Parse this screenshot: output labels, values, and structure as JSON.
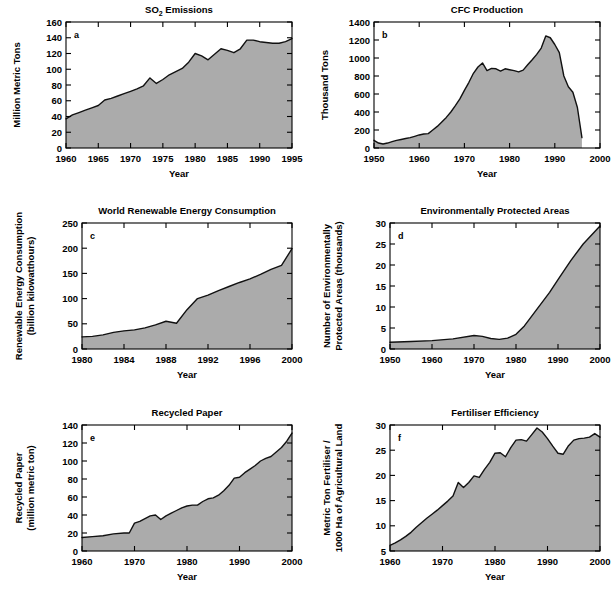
{
  "figure": {
    "background": "#ffffff",
    "series_fill": "#ababab",
    "series_stroke": "#1a1a1a",
    "axis_color": "#000000",
    "panel_count": 6
  },
  "chart_data": [
    {
      "id": "a",
      "panel_letter": "a",
      "type": "area",
      "title": "SO2 Emissions",
      "title_parts": {
        "pre": "SO",
        "sub": "2",
        "post": " Emissions"
      },
      "xlabel": "Year",
      "ylabel": "Million Metric Tons",
      "ylabel_lines": [
        "Million Metric Tons"
      ],
      "xlim": [
        1960,
        1995
      ],
      "ylim": [
        0,
        160
      ],
      "xticks": [
        1960,
        1965,
        1970,
        1975,
        1980,
        1985,
        1990,
        1995
      ],
      "yticks": [
        0,
        20,
        40,
        60,
        80,
        100,
        120,
        140,
        160
      ],
      "xtick_labels": [
        "1960",
        "1965",
        "1970",
        "1975",
        "1980",
        "1985",
        "1990",
        "1995"
      ],
      "ytick_labels": [
        "0",
        "20",
        "40",
        "60",
        "80",
        "100",
        "120",
        "140",
        "160"
      ],
      "grid": false,
      "legend": "none",
      "x": [
        1960,
        1961,
        1962,
        1963,
        1964,
        1965,
        1966,
        1967,
        1968,
        1969,
        1970,
        1971,
        1972,
        1973,
        1974,
        1975,
        1976,
        1977,
        1978,
        1979,
        1980,
        1981,
        1982,
        1983,
        1984,
        1985,
        1986,
        1987,
        1988,
        1989,
        1990,
        1991,
        1992,
        1993,
        1994,
        1995
      ],
      "values": [
        37,
        42,
        45,
        48,
        51,
        54,
        61,
        63,
        66,
        69,
        72,
        75,
        79,
        89,
        82,
        87,
        93,
        97,
        101,
        109,
        120,
        117,
        112,
        119,
        126,
        124,
        121,
        126,
        137,
        137,
        135,
        134,
        133,
        133,
        135,
        139
      ]
    },
    {
      "id": "b",
      "panel_letter": "b",
      "type": "area",
      "title": "CFC Production",
      "xlabel": "Year",
      "ylabel": "Thousand Tons",
      "ylabel_lines": [
        "Thousand Tons"
      ],
      "xlim": [
        1950,
        2000
      ],
      "ylim": [
        0,
        1400
      ],
      "xticks": [
        1950,
        1960,
        1970,
        1980,
        1990,
        2000
      ],
      "yticks": [
        0,
        200,
        400,
        600,
        800,
        1000,
        1200,
        1400
      ],
      "xtick_labels": [
        "1950",
        "1960",
        "1970",
        "1980",
        "1990",
        "2000"
      ],
      "ytick_labels": [
        "0",
        "200",
        "400",
        "600",
        "800",
        "1000",
        "1200",
        "1400"
      ],
      "grid": false,
      "legend": "none",
      "x": [
        1950,
        1951,
        1952,
        1953,
        1954,
        1955,
        1956,
        1957,
        1958,
        1959,
        1960,
        1961,
        1962,
        1963,
        1964,
        1965,
        1966,
        1967,
        1968,
        1969,
        1970,
        1971,
        1972,
        1973,
        1974,
        1975,
        1976,
        1977,
        1978,
        1979,
        1980,
        1981,
        1982,
        1983,
        1984,
        1985,
        1986,
        1987,
        1988,
        1989,
        1990,
        1991,
        1992,
        1993,
        1994,
        1995,
        1996
      ],
      "values": [
        85,
        55,
        45,
        55,
        70,
        85,
        95,
        105,
        115,
        130,
        145,
        155,
        160,
        200,
        240,
        290,
        340,
        400,
        470,
        545,
        640,
        730,
        830,
        900,
        945,
        860,
        885,
        880,
        855,
        880,
        870,
        860,
        845,
        865,
        925,
        980,
        1040,
        1110,
        1245,
        1225,
        1150,
        1060,
        800,
        680,
        620,
        450,
        115
      ]
    },
    {
      "id": "c",
      "panel_letter": "c",
      "type": "area",
      "title": "World Renewable Energy Consumption",
      "xlabel": "Year",
      "ylabel": "Renewable Energy Consumption (billion kilowatthours)",
      "ylabel_lines": [
        "Renewable Energy Consumption",
        "(billion kilowatthours)"
      ],
      "xlim": [
        1980,
        2000
      ],
      "ylim": [
        0,
        250
      ],
      "xticks": [
        1980,
        1984,
        1988,
        1992,
        1996,
        2000
      ],
      "yticks": [
        0,
        50,
        100,
        150,
        200,
        250
      ],
      "xtick_labels": [
        "1980",
        "1984",
        "1988",
        "1992",
        "1996",
        "2000"
      ],
      "ytick_labels": [
        "0",
        "50",
        "100",
        "150",
        "200",
        "250"
      ],
      "grid": false,
      "legend": "none",
      "x": [
        1980,
        1981,
        1982,
        1983,
        1984,
        1985,
        1986,
        1987,
        1988,
        1989,
        1990,
        1991,
        1992,
        1993,
        1994,
        1995,
        1996,
        1997,
        1998,
        1999,
        2000
      ],
      "values": [
        24,
        25,
        28,
        33,
        36,
        38,
        42,
        48,
        55,
        51,
        78,
        100,
        107,
        116,
        124,
        132,
        139,
        148,
        158,
        166,
        199
      ]
    },
    {
      "id": "d",
      "panel_letter": "d",
      "type": "area",
      "title": "Environmentally Protected Areas",
      "xlabel": "Year",
      "ylabel": "Number of Environmentally Protected Areas (thousands)",
      "ylabel_lines": [
        "Number of Environmentally",
        "Protected Areas (thousands)"
      ],
      "xlim": [
        1950,
        2000
      ],
      "ylim": [
        0,
        30
      ],
      "xticks": [
        1950,
        1960,
        1970,
        1980,
        1990,
        2000
      ],
      "yticks": [
        0,
        5,
        10,
        15,
        20,
        25,
        30
      ],
      "xtick_labels": [
        "1950",
        "1960",
        "1970",
        "1980",
        "1990",
        "2000"
      ],
      "ytick_labels": [
        "0",
        "5",
        "10",
        "15",
        "20",
        "25",
        "30"
      ],
      "grid": false,
      "legend": "none",
      "x": [
        1950,
        1955,
        1960,
        1965,
        1970,
        1972,
        1974,
        1976,
        1978,
        1980,
        1982,
        1985,
        1988,
        1990,
        1993,
        1996,
        2000
      ],
      "values": [
        1.6,
        1.8,
        2.0,
        2.4,
        3.2,
        3.0,
        2.5,
        2.3,
        2.6,
        3.5,
        5.5,
        9.5,
        13.5,
        16.5,
        21.0,
        25.0,
        29.3
      ]
    },
    {
      "id": "e",
      "panel_letter": "e",
      "type": "area",
      "title": "Recycled Paper",
      "xlabel": "Year",
      "ylabel": "Recycled Paper (million metric ton)",
      "ylabel_lines": [
        "Recycled Paper",
        "(million metric ton)"
      ],
      "xlim": [
        1960,
        2000
      ],
      "ylim": [
        0,
        140
      ],
      "xticks": [
        1960,
        1970,
        1980,
        1990,
        2000
      ],
      "yticks": [
        0,
        20,
        40,
        60,
        80,
        100,
        120,
        140
      ],
      "xtick_labels": [
        "1960",
        "1970",
        "1980",
        "1990",
        "2000"
      ],
      "ytick_labels": [
        "0",
        "20",
        "40",
        "60",
        "80",
        "100",
        "120",
        "140"
      ],
      "grid": false,
      "legend": "none",
      "x": [
        1960,
        1962,
        1964,
        1966,
        1968,
        1969,
        1970,
        1971,
        1972,
        1973,
        1974,
        1975,
        1976,
        1977,
        1978,
        1979,
        1980,
        1981,
        1982,
        1983,
        1984,
        1985,
        1986,
        1987,
        1988,
        1989,
        1990,
        1991,
        1992,
        1993,
        1994,
        1995,
        1996,
        1997,
        1998,
        1999,
        2000
      ],
      "values": [
        15,
        16,
        17,
        19,
        20,
        20,
        31,
        33,
        36,
        39,
        40,
        35,
        39,
        42,
        45,
        48,
        50,
        51,
        51,
        55,
        58,
        59,
        62,
        67,
        73,
        81,
        82,
        87,
        91,
        95,
        100,
        103,
        105,
        110,
        115,
        122,
        131
      ]
    },
    {
      "id": "f",
      "panel_letter": "f",
      "type": "area",
      "title": "Fertiliser Efficiency",
      "xlabel": "Year",
      "ylabel": "Metric Ton Fertiliser / 1000 Ha of Agricultural Land",
      "ylabel_lines": [
        "Metric Ton Fertiliser /",
        "1000 Ha of Agricultural Land"
      ],
      "xlim": [
        1960,
        2000
      ],
      "ylim": [
        5,
        30
      ],
      "xticks": [
        1960,
        1970,
        1980,
        1990,
        2000
      ],
      "yticks": [
        5,
        10,
        15,
        20,
        25,
        30
      ],
      "xtick_labels": [
        "1960",
        "1970",
        "1980",
        "1990",
        "2000"
      ],
      "ytick_labels": [
        "5",
        "10",
        "15",
        "20",
        "25",
        "30"
      ],
      "grid": false,
      "legend": "none",
      "x": [
        1960,
        1961,
        1962,
        1963,
        1964,
        1965,
        1966,
        1967,
        1968,
        1969,
        1970,
        1971,
        1972,
        1973,
        1974,
        1975,
        1976,
        1977,
        1978,
        1979,
        1980,
        1981,
        1982,
        1983,
        1984,
        1985,
        1986,
        1987,
        1988,
        1989,
        1990,
        1991,
        1992,
        1993,
        1994,
        1995,
        1996,
        1997,
        1998,
        1999,
        2000
      ],
      "values": [
        6.1,
        6.6,
        7.2,
        7.9,
        8.7,
        9.7,
        10.6,
        11.5,
        12.3,
        13.1,
        14.0,
        14.9,
        15.9,
        18.6,
        17.6,
        18.6,
        19.9,
        19.6,
        21.2,
        22.6,
        24.4,
        24.5,
        23.7,
        25.5,
        27.0,
        27.1,
        26.8,
        28.1,
        29.4,
        28.6,
        27.3,
        25.8,
        24.4,
        24.2,
        25.9,
        27.0,
        27.3,
        27.4,
        27.6,
        28.3,
        27.6
      ]
    }
  ]
}
